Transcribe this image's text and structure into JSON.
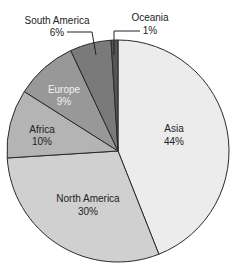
{
  "chart_data": {
    "type": "pie",
    "title": "",
    "start_angle_deg": 0,
    "direction": "clockwise",
    "legend": "none",
    "slices": [
      {
        "label": "Asia",
        "value": 44,
        "display": "44%",
        "color": "#ececec",
        "label_color": "#222222"
      },
      {
        "label": "North America",
        "value": 30,
        "display": "30%",
        "color": "#d0d0d0",
        "label_color": "#222222"
      },
      {
        "label": "Africa",
        "value": 10,
        "display": "10%",
        "color": "#b4b4b4",
        "label_color": "#222222"
      },
      {
        "label": "Europe",
        "value": 9,
        "display": "9%",
        "color": "#989898",
        "label_color": "#f2f2f2"
      },
      {
        "label": "South America",
        "value": 6,
        "display": "6%",
        "color": "#7a7a7a",
        "label_color": "#222222"
      },
      {
        "label": "Oceania",
        "value": 1,
        "display": "1%",
        "color": "#555555",
        "label_color": "#222222"
      }
    ],
    "units": "%"
  },
  "labels": {
    "asia": {
      "name": "Asia",
      "pct": "44%"
    },
    "north_america": {
      "name": "North America",
      "pct": "30%"
    },
    "africa": {
      "name": "Africa",
      "pct": "10%"
    },
    "europe": {
      "name": "Europe",
      "pct": "9%"
    },
    "south_america": {
      "name": "South America",
      "pct": "6%"
    },
    "oceania": {
      "name": "Oceania",
      "pct": "1%"
    }
  }
}
